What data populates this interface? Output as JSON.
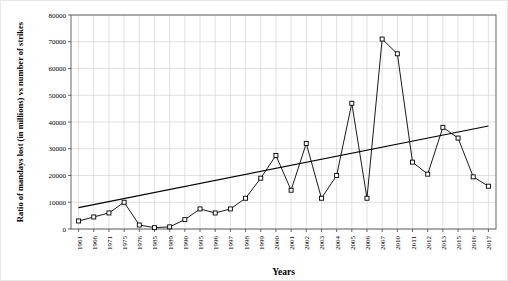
{
  "chart_data": {
    "type": "line",
    "title": "",
    "xlabel": "Years",
    "ylabel": "Ratio of mandays lost (in millions) vs number of strikes",
    "ylim": [
      0,
      80000
    ],
    "ytick_values": [
      0,
      10000,
      20000,
      30000,
      40000,
      50000,
      60000,
      70000,
      80000
    ],
    "ytick_labels": [
      "0",
      "10000",
      "20000",
      "30000",
      "40000",
      "50000",
      "60000",
      "70000",
      "80000"
    ],
    "grid": true,
    "legend": "none",
    "categories": [
      "1961",
      "1966",
      "1971",
      "1975",
      "1976",
      "1985",
      "1989",
      "1990",
      "1995",
      "1996",
      "1997",
      "1998",
      "1999",
      "2000",
      "2001",
      "2002",
      "2003",
      "2004",
      "2005",
      "2006",
      "2007",
      "2010",
      "2011",
      "2012",
      "2013",
      "2015",
      "2016",
      "2017"
    ],
    "series": [
      {
        "name": "Ratio of mandays lost vs number of strikes",
        "marker": "square-open",
        "values": [
          3000,
          4500,
          6000,
          10000,
          1500,
          500,
          800,
          3500,
          7500,
          6000,
          7500,
          11500,
          19000,
          27500,
          14500,
          32000,
          11500,
          20000,
          47000,
          11500,
          71000,
          65500,
          25000,
          20500,
          38000,
          34000,
          19500,
          16000
        ]
      }
    ],
    "trendline": {
      "name": "linear trend",
      "x_start_category": "1961",
      "x_end_category": "2017",
      "y_start": 8000,
      "y_end": 38500
    }
  }
}
